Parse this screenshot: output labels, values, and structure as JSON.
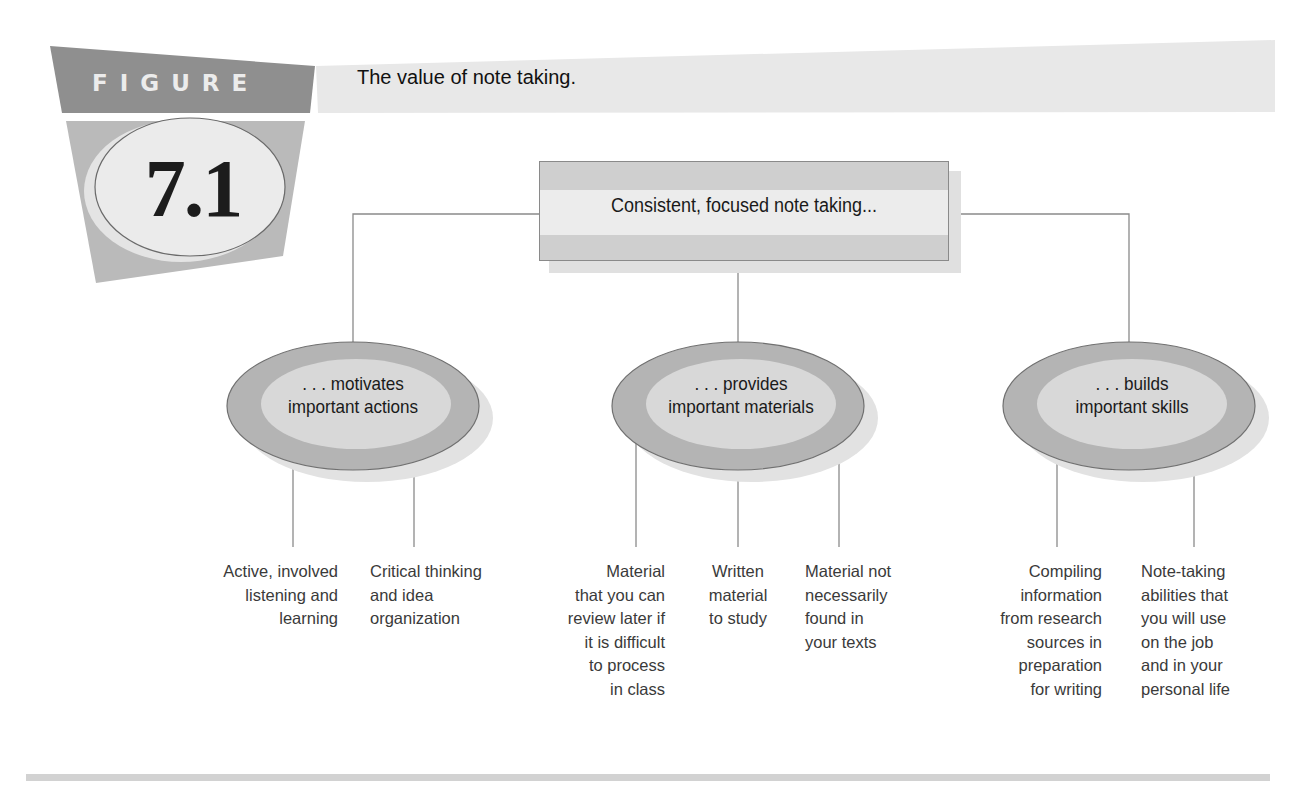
{
  "figure": {
    "label": "FIGURE",
    "number": "7.1",
    "title": "The value of note taking."
  },
  "diagram": {
    "root": {
      "label": "Consistent, focused note taking..."
    },
    "branches": [
      {
        "label_line1": ". . . motivates",
        "label_line2": "important actions",
        "leaves": [
          {
            "text": "Active, involved\nlistening and\nlearning",
            "align": "right"
          },
          {
            "text": "Critical thinking\nand idea\norganization",
            "align": "left"
          }
        ]
      },
      {
        "label_line1": ". . . provides",
        "label_line2": "important materials",
        "leaves": [
          {
            "text": "Material\nthat you can\nreview later if\nit is difficult\nto process\nin class",
            "align": "right"
          },
          {
            "text": "Written\nmaterial\nto study",
            "align": "center"
          },
          {
            "text": "Material not\nnecessarily\nfound in\nyour texts",
            "align": "left"
          }
        ]
      },
      {
        "label_line1": ". . . builds",
        "label_line2": "important skills",
        "leaves": [
          {
            "text": "Compiling\ninformation\nfrom research\nsources in\npreparation\nfor writing",
            "align": "right"
          },
          {
            "text": "Note-taking\nabilities that\nyou will use\non the job\nand in your\npersonal life",
            "align": "left"
          }
        ]
      }
    ]
  },
  "colors": {
    "badge_dark": "#8f8f8f",
    "badge_light": "#b9b9b9",
    "title_band": "#e6e6e6",
    "ellipse_outer": "#b4b4b4",
    "ellipse_inner": "#d9d9d9",
    "line": "#8a8a8a",
    "divider": "#d2d2d2"
  }
}
